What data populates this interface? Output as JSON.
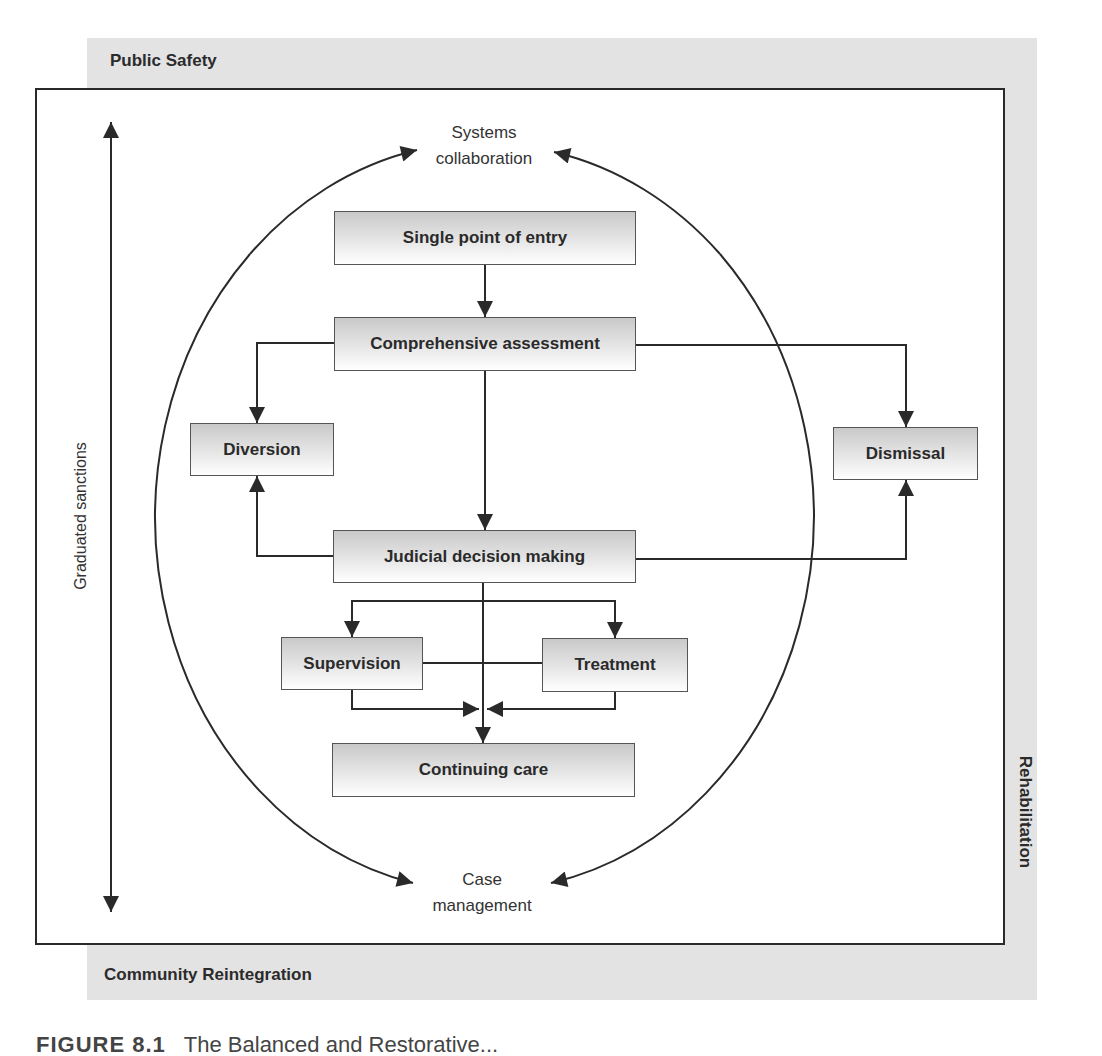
{
  "diagram": {
    "outer_labels": {
      "top": "Public Safety",
      "bottom": "Community Reintegration",
      "right": "Rehabilitation",
      "left": "Graduated sanctions"
    },
    "cycle_labels": {
      "top": "Systems collaboration",
      "top_line1": "Systems",
      "top_line2": "collaboration",
      "bottom": "Case management",
      "bottom_line1": "Case",
      "bottom_line2": "management"
    },
    "nodes": [
      {
        "id": "single_point_of_entry",
        "label": "Single point of entry"
      },
      {
        "id": "comprehensive_assessment",
        "label": "Comprehensive assessment"
      },
      {
        "id": "diversion",
        "label": "Diversion"
      },
      {
        "id": "dismissal",
        "label": "Dismissal"
      },
      {
        "id": "judicial_decision_making",
        "label": "Judicial decision making"
      },
      {
        "id": "supervision",
        "label": "Supervision"
      },
      {
        "id": "treatment",
        "label": "Treatment"
      },
      {
        "id": "continuing_care",
        "label": "Continuing care"
      }
    ],
    "edges": [
      {
        "from": "single_point_of_entry",
        "to": "comprehensive_assessment"
      },
      {
        "from": "comprehensive_assessment",
        "to": "diversion"
      },
      {
        "from": "comprehensive_assessment",
        "to": "dismissal"
      },
      {
        "from": "comprehensive_assessment",
        "to": "judicial_decision_making"
      },
      {
        "from": "judicial_decision_making",
        "to": "diversion"
      },
      {
        "from": "judicial_decision_making",
        "to": "dismissal"
      },
      {
        "from": "judicial_decision_making",
        "to": "supervision"
      },
      {
        "from": "judicial_decision_making",
        "to": "treatment"
      },
      {
        "from": "judicial_decision_making",
        "to": "continuing_care"
      },
      {
        "from": "supervision",
        "to": "treatment",
        "type": "link"
      },
      {
        "from": "supervision",
        "to": "continuing_care"
      },
      {
        "from": "treatment",
        "to": "continuing_care"
      }
    ],
    "colors": {
      "band": "#e3e3e3",
      "line": "#2a2a2a",
      "box_top": "#c9c9c9",
      "box_bottom": "#ffffff"
    }
  },
  "caption": {
    "figure_number": "FIGURE 8.1",
    "text": "The Balanced and Restorative..."
  }
}
